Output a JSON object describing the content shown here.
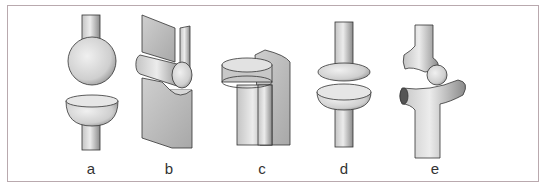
{
  "figure": {
    "joints": [
      {
        "id": "a",
        "label": "a",
        "name": "ball-and-socket"
      },
      {
        "id": "b",
        "label": "b",
        "name": "hinge"
      },
      {
        "id": "c",
        "label": "c",
        "name": "pivot"
      },
      {
        "id": "d",
        "label": "d",
        "name": "ellipsoid"
      },
      {
        "id": "e",
        "label": "e",
        "name": "saddle"
      }
    ]
  }
}
